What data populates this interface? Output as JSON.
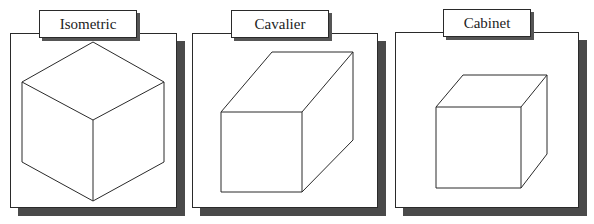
{
  "diagram": {
    "title": "",
    "panels": [
      {
        "label": "Isometric",
        "projection": "isometric",
        "panel_box": [
          10,
          33,
          177,
          208
        ],
        "label_box": [
          39,
          10,
          137,
          38
        ],
        "cube": {
          "vertices": {
            "top": [
              93,
              42
            ],
            "left_up": [
              22,
              82
            ],
            "right_up": [
              164,
              82
            ],
            "center": [
              93,
              120
            ],
            "left_low": [
              22,
              162
            ],
            "right_low": [
              164,
              162
            ],
            "bottom": [
              93,
              201
            ]
          }
        }
      },
      {
        "label": "Cavalier",
        "projection": "cavalier",
        "panel_box": [
          192,
          33,
          378,
          208
        ],
        "label_box": [
          231,
          10,
          329,
          38
        ],
        "cube": {
          "front_face": [
            [
              221,
              112
            ],
            [
              302,
              112
            ],
            [
              302,
              192
            ],
            [
              221,
              192
            ]
          ],
          "back_top_left": [
            272,
            52
          ],
          "back_top_right": [
            353,
            52
          ],
          "back_bottom_right": [
            353,
            140
          ]
        }
      },
      {
        "label": "Cabinet",
        "projection": "cabinet",
        "panel_box": [
          395,
          32,
          579,
          208
        ],
        "label_box": [
          443,
          9,
          531,
          37
        ],
        "cube": {
          "front_face": [
            [
              436,
              107
            ],
            [
              521,
              107
            ],
            [
              521,
              188
            ],
            [
              436,
              188
            ]
          ],
          "back_top_left": [
            463,
            75
          ],
          "back_top_right": [
            547,
            75
          ],
          "back_bottom_right": [
            547,
            154
          ]
        }
      }
    ],
    "colors": {
      "line": "#2a2a2a",
      "shadow": "#4a4a4a",
      "background": "#ffffff"
    }
  }
}
